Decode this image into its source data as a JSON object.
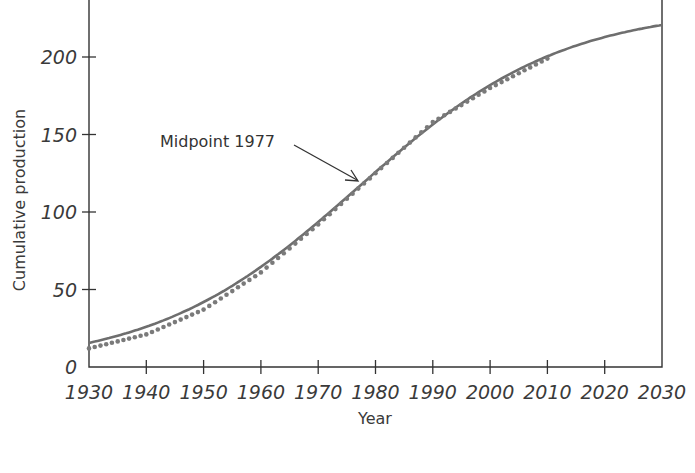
{
  "chart_data": {
    "type": "line",
    "title": "",
    "xlabel": "Year",
    "ylabel": "Cumulative production",
    "xlim": [
      1930,
      2030
    ],
    "ylim": [
      0,
      230
    ],
    "x_ticks": [
      1930,
      1940,
      1950,
      1960,
      1970,
      1980,
      1990,
      2000,
      2010,
      2020,
      2030
    ],
    "y_ticks": [
      0,
      50,
      100,
      150,
      200
    ],
    "grid": false,
    "legend": null,
    "series": [
      {
        "name": "Logistic fit",
        "style": "solid",
        "color": "#6e6e6e",
        "model": {
          "type": "logistic",
          "L": 232,
          "midpoint": 1977,
          "k": 0.056
        },
        "x": [
          1930,
          1940,
          1950,
          1960,
          1970,
          1977,
          1980,
          1990,
          2000,
          2010,
          2020,
          2030
        ],
        "values": [
          16,
          26,
          42,
          64,
          92,
          116,
          125,
          157,
          183,
          201,
          213,
          220
        ]
      },
      {
        "name": "Observed cumulative production",
        "style": "dotted",
        "color": "#7a7a7a",
        "x": [
          1930,
          1940,
          1950,
          1960,
          1970,
          1980,
          1990,
          2000,
          2010
        ],
        "values": [
          12,
          21,
          37,
          61,
          92,
          125,
          158,
          180,
          199
        ]
      }
    ],
    "annotations": [
      {
        "text": "Midpoint 1977",
        "x": 1977,
        "y": 116,
        "arrow": true
      }
    ]
  },
  "labels": {
    "xlabel": "Year",
    "ylabel": "Cumulative production",
    "annotation": "Midpoint 1977",
    "x_ticks": [
      "1930",
      "1940",
      "1950",
      "1960",
      "1970",
      "1980",
      "1990",
      "2000",
      "2010",
      "2020",
      "2030"
    ],
    "y_ticks": [
      "0",
      "50",
      "100",
      "150",
      "200"
    ]
  }
}
